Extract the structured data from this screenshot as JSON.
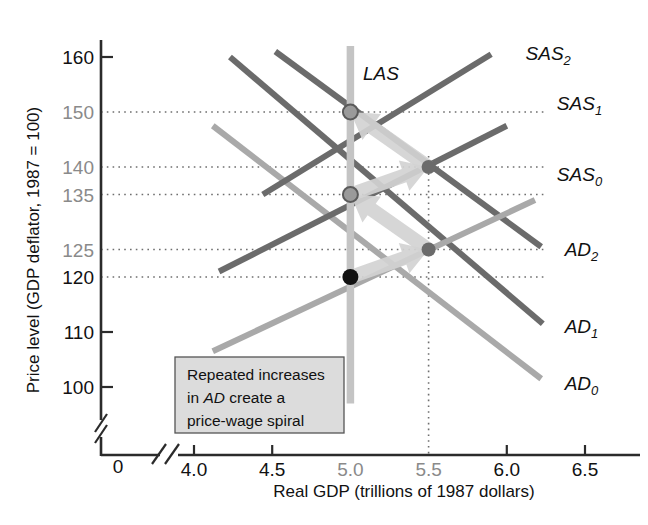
{
  "chart_data": {
    "type": "line",
    "title": "",
    "xlabel": "Real GDP (trillions of 1987 dollars)",
    "ylabel": "Price level (GDP deflator, 1987 = 100)",
    "xlim": [
      3.75,
      6.7
    ],
    "ylim": [
      95,
      163
    ],
    "xticks": [
      "4.0",
      "4.5",
      "5.0",
      "5.5",
      "6.0",
      "6.5"
    ],
    "xtick_values": [
      4.0,
      4.5,
      5.0,
      5.5,
      6.0,
      6.5
    ],
    "yticks": [
      "160",
      "150",
      "140",
      "135",
      "125",
      "120",
      "110",
      "100"
    ],
    "ytick_values": [
      160,
      150,
      140,
      135,
      125,
      120,
      110,
      100
    ],
    "origin_label": "0",
    "grid": "dotted-horizontal-at-markers",
    "legend": "inline-curve-labels",
    "axis_breaks": [
      "x-axis-break-near-origin",
      "y-axis-break-below-100"
    ],
    "series": [
      {
        "name": "AD0",
        "label": "AD",
        "sub": "0",
        "color": "#a9a9a9",
        "kind": "aggregate-demand",
        "points": [
          [
            4.12,
            147.5
          ],
          [
            6.22,
            101.5
          ]
        ],
        "label_pos": [
          6.37,
          100.5
        ]
      },
      {
        "name": "AD1",
        "label": "AD",
        "sub": "1",
        "color": "#6b6b6b",
        "kind": "aggregate-demand",
        "points": [
          [
            4.23,
            160.0
          ],
          [
            6.23,
            111.5
          ]
        ],
        "label_pos": [
          6.37,
          111.0
        ]
      },
      {
        "name": "AD2",
        "label": "AD",
        "sub": "2",
        "color": "#6b6b6b",
        "kind": "aggregate-demand",
        "points": [
          [
            4.52,
            161.0
          ],
          [
            6.22,
            125.5
          ]
        ],
        "label_pos": [
          6.37,
          125.0
        ]
      },
      {
        "name": "SAS0",
        "label": "SAS",
        "sub": "0",
        "color": "#a9a9a9",
        "kind": "short-run-aggregate-supply",
        "points": [
          [
            4.12,
            106.5
          ],
          [
            6.18,
            134.0
          ]
        ],
        "label_pos": [
          6.32,
          138.5
        ]
      },
      {
        "name": "SAS1",
        "label": "SAS",
        "sub": "1",
        "color": "#6b6b6b",
        "kind": "short-run-aggregate-supply",
        "points": [
          [
            4.16,
            121.0
          ],
          [
            6.0,
            147.5
          ]
        ],
        "label_pos": [
          6.32,
          151.5
        ]
      },
      {
        "name": "SAS2",
        "label": "SAS",
        "sub": "2",
        "color": "#6b6b6b",
        "kind": "short-run-aggregate-supply",
        "points": [
          [
            4.44,
            135.0
          ],
          [
            5.9,
            160.5
          ]
        ],
        "label_pos": [
          6.12,
          160.5
        ]
      },
      {
        "name": "LAS",
        "label": "LAS",
        "sub": "",
        "color": "#c4c4c4",
        "kind": "long-run-aggregate-supply",
        "points": [
          [
            5.0,
            97.0
          ],
          [
            5.0,
            162.0
          ]
        ],
        "label_pos": [
          5.08,
          157.0
        ]
      }
    ],
    "equilibrium_points": [
      {
        "name": "initial-equilibrium",
        "x": 5.0,
        "y": 120,
        "style": "filled-black"
      },
      {
        "name": "short-run-equilibrium-1",
        "x": 5.5,
        "y": 125,
        "style": "filled-gray"
      },
      {
        "name": "long-run-equilibrium-1",
        "x": 5.0,
        "y": 135,
        "style": "gray-ring"
      },
      {
        "name": "short-run-equilibrium-2",
        "x": 5.5,
        "y": 140,
        "style": "filled-gray"
      },
      {
        "name": "long-run-equilibrium-2",
        "x": 5.0,
        "y": 150,
        "style": "gray-ring"
      }
    ],
    "spiral_arrows": [
      {
        "from": [
          5.0,
          120
        ],
        "to": [
          5.5,
          125
        ]
      },
      {
        "from": [
          5.5,
          125
        ],
        "to": [
          5.0,
          135
        ]
      },
      {
        "from": [
          5.0,
          135
        ],
        "to": [
          5.5,
          140
        ]
      },
      {
        "from": [
          5.5,
          140
        ],
        "to": [
          5.0,
          150
        ]
      }
    ],
    "dotted_guides": {
      "horizontal_at": [
        150,
        140,
        135,
        125,
        120
      ],
      "vertical_at": [
        5.5
      ]
    },
    "annotation_box": {
      "lines": [
        "Repeated increases",
        "in AD create a",
        "price-wage spiral"
      ],
      "line1_plain": "Repeated increases",
      "line2_prefix": "in ",
      "line2_em": "AD",
      "line2_suffix": " create a",
      "line3_plain": "price-wage spiral",
      "bg": "#dcdcdc",
      "border": "#555555"
    }
  },
  "colors": {
    "axis": "#2b2b2b",
    "dark_curve": "#6b6b6b",
    "light_curve": "#a9a9a9",
    "las_curve": "#c4c4c4",
    "arrow": "#d2d2d2",
    "gridline": "#6f6f6f",
    "marker_black": "#111111",
    "marker_gray": "#6b6b6b",
    "background": "#ffffff"
  }
}
